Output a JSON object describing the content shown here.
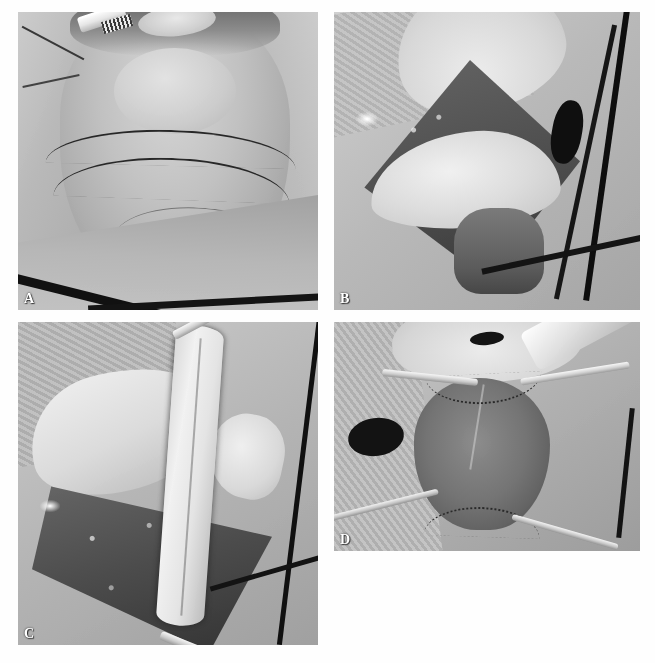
{
  "figure": {
    "background_color": "#ffffff",
    "panel_count": 4,
    "layout": "2x2 grid of grayscale intraoperative photographs",
    "panels": [
      {
        "id": "panel-a",
        "label": "A",
        "caption_text": "",
        "description": "Preoperative view of draped anterior neck and chin with black surgical skin-marking incision lines; white clip/tape at upper left and dark tubing crossing the lower drape.",
        "modality": "clinical photograph",
        "color_mode": "grayscale",
        "position": "top-left",
        "rect": {
          "x": 18,
          "y": 12,
          "w": 300,
          "h": 298
        }
      },
      {
        "id": "panel-b",
        "label": "B",
        "caption_text": "",
        "description": "Intraoperative exposure: diamond-shaped open neck wound with retracted pale soft-tissue flaps, darker deep tissue bed and black tubing at the right margin.",
        "modality": "clinical photograph",
        "color_mode": "grayscale",
        "position": "top-right",
        "rect": {
          "x": 334,
          "y": 12,
          "w": 306,
          "h": 298
        }
      },
      {
        "id": "panel-c",
        "label": "C",
        "caption_text": "",
        "description": "Harvested vertical strip of pale tissue (graft/flap) held taut by metal clamps at top and bottom across the open surgical field.",
        "modality": "clinical photograph",
        "color_mode": "grayscale",
        "position": "bottom-left",
        "rect": {
          "x": 18,
          "y": 322,
          "w": 300,
          "h": 323
        }
      },
      {
        "id": "panel-d",
        "label": "D",
        "caption_text": "",
        "description": "Reconstructed defect: darker graft inset and sutured in place, held open by several metal retractors; a larger instrument enters from the upper right.",
        "modality": "clinical photograph",
        "color_mode": "grayscale",
        "position": "bottom-right",
        "rect": {
          "x": 334,
          "y": 322,
          "w": 306,
          "h": 229
        }
      }
    ],
    "label_style": {
      "color": "#ffffff",
      "weight": "bold",
      "position": "bottom-left of each panel"
    }
  }
}
